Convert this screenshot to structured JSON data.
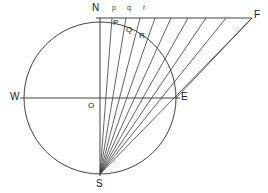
{
  "figure": {
    "background_color": "#ffffff",
    "line_color": "#3b3b3b",
    "axis_color": "#2e2e2e",
    "label_color": "#1a1a1a"
  },
  "labels": {
    "north": "N",
    "south": "S",
    "west": "W",
    "east": "E",
    "origin": "O",
    "far_point": "F",
    "arc_p": "P",
    "arc_q": "Q",
    "arc_r": "R",
    "top_p": "p",
    "top_q": "q",
    "top_r": "r"
  },
  "geometry": {
    "center": {
      "x": 100,
      "y": 98
    },
    "radius": 76,
    "north_point": {
      "x": 100,
      "y": 22
    },
    "south_point": {
      "x": 100,
      "y": 174
    },
    "west_point": {
      "x": 24,
      "y": 98
    },
    "east_point": {
      "x": 176,
      "y": 98
    },
    "far_point": {
      "x": 252,
      "y": 18
    },
    "top_line": {
      "x1": 96,
      "y1": 18,
      "x2": 252,
      "y2": 18
    },
    "horizontal_axis": {
      "x1": 20,
      "y1": 98,
      "x2": 180,
      "y2": 98
    },
    "vertical_axis": {
      "x1": 100,
      "y1": 18,
      "x2": 100,
      "y2": 176
    },
    "ray_endpoints_on_top_line": [
      {
        "x": 100,
        "y": 18
      },
      {
        "x": 112,
        "y": 18
      },
      {
        "x": 126,
        "y": 18
      },
      {
        "x": 140,
        "y": 18
      },
      {
        "x": 155,
        "y": 18
      },
      {
        "x": 171,
        "y": 18
      },
      {
        "x": 188,
        "y": 18
      },
      {
        "x": 206,
        "y": 18
      },
      {
        "x": 226,
        "y": 18
      },
      {
        "x": 252,
        "y": 18
      }
    ],
    "arc_intersection_points": [
      {
        "label": "P",
        "x": 114,
        "y": 27
      },
      {
        "label": "Q",
        "x": 128,
        "y": 33
      },
      {
        "label": "R",
        "x": 141,
        "y": 40
      }
    ]
  },
  "label_positions": {
    "N": {
      "x": 92,
      "y": 4
    },
    "p": {
      "x": 112,
      "y": 5
    },
    "q": {
      "x": 127,
      "y": 5
    },
    "r": {
      "x": 142,
      "y": 5
    },
    "F": {
      "x": 254,
      "y": 10
    },
    "P": {
      "x": 113,
      "y": 21
    },
    "Q": {
      "x": 126,
      "y": 28
    },
    "R": {
      "x": 139,
      "y": 34
    },
    "W": {
      "x": 11,
      "y": 91
    },
    "E": {
      "x": 180,
      "y": 91
    },
    "O": {
      "x": 88,
      "y": 101
    },
    "S": {
      "x": 96,
      "y": 179
    }
  }
}
